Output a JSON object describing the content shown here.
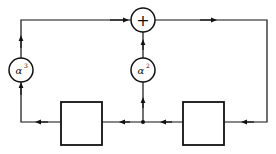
{
  "diagram": {
    "type": "signal-flow / shift-register block diagram",
    "adder": {
      "symbol": "+"
    },
    "multipliers": [
      {
        "id": "left",
        "base": "α",
        "exponent": "3"
      },
      {
        "id": "middle",
        "base": "α",
        "exponent": "2"
      }
    ],
    "delay_blocks": [
      {
        "id": "left",
        "label": ""
      },
      {
        "id": "right",
        "label": ""
      }
    ],
    "colors": {
      "stroke": "#111111",
      "background": "#ffffff"
    }
  }
}
